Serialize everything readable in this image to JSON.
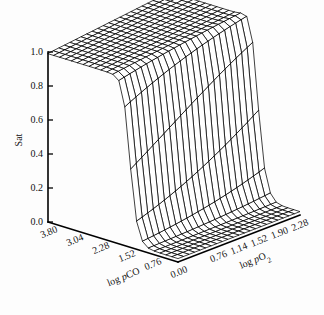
{
  "figure": {
    "background_color": "#fdfdfd",
    "ink_color": "#000000",
    "width": 324,
    "height": 315
  },
  "chart_data": {
    "type": "line",
    "render_style": "3d-wireframe-surface",
    "title": "",
    "subtitle": "",
    "zlabel": "Sat",
    "xlabel": "log pCO",
    "ylabel": "log pO2",
    "xlabel_html": "log <i>p</i>CO",
    "ylabel_html": "log <i>p</i>O₂",
    "grid": true,
    "legend": "none",
    "zlim": [
      0.0,
      1.0
    ],
    "z_ticks": [
      "1.0",
      "0.8",
      "0.6",
      "0.4",
      "0.2",
      "0.0"
    ],
    "z_tick_values": [
      1.0,
      0.8,
      0.6,
      0.4,
      0.2,
      0.0
    ],
    "xlim": [
      0.0,
      3.8
    ],
    "x_ticks": [
      "3.80",
      "3.04",
      "2.28",
      "1.52",
      "0.76",
      "0.00"
    ],
    "x_tick_values": [
      3.8,
      3.04,
      2.28,
      1.52,
      0.76,
      0.0
    ],
    "ylim": [
      0.0,
      2.28
    ],
    "y_ticks": [
      "0.00",
      "0.76",
      "1.14",
      "1.52",
      "1.90",
      "2.28"
    ],
    "y_tick_values": [
      0.0,
      0.76,
      1.14,
      1.52,
      1.9,
      2.28
    ],
    "surface_model": {
      "description": "Saturation is high (near 1) at high log pCO and falls through a very steep sigmoidal cliff to near 0 as log pCO decreases, with a mild rise toward high log pO2 on the high side.",
      "nx": 22,
      "ny": 22,
      "cliff_center_x": 1.42,
      "cliff_steepness": 9.5,
      "plateau_high": 0.99,
      "plateau_low": 0.02,
      "o2_gain": 0.085,
      "o2_shift": 0.16,
      "ridge_boost": 0.12
    },
    "annotations": []
  },
  "geometry": {
    "origin_x": 48,
    "origin_y": 222,
    "z_top_y": 52,
    "front_apex_x": 178,
    "front_apex_y": 262,
    "right_corner_x": 300,
    "right_corner_y": 215
  }
}
